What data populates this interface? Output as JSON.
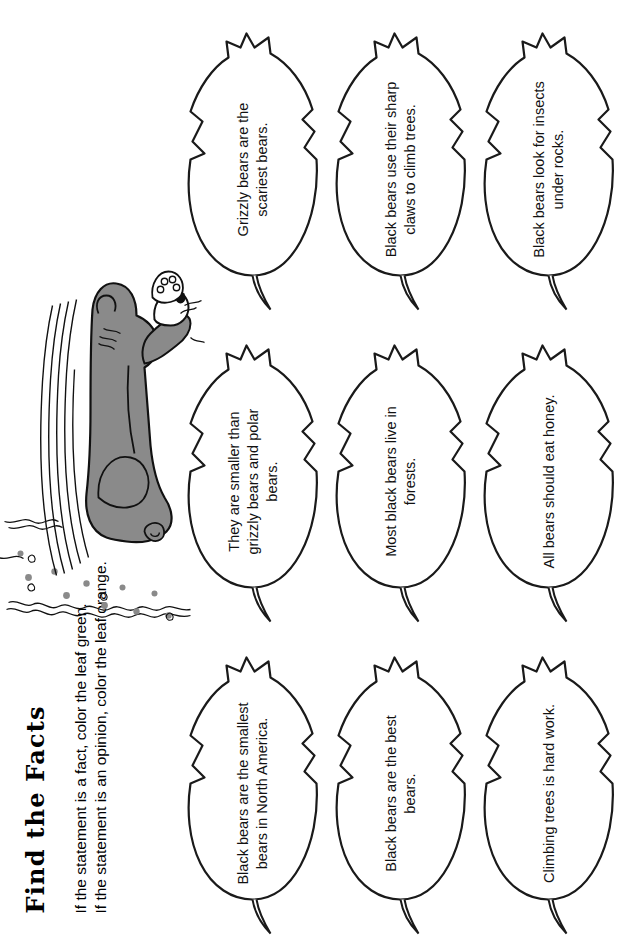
{
  "worksheet": {
    "title": "Find the Facts",
    "instructions": [
      "If the statement is a fact, color the leaf green.",
      "If the statement is an opinion, color the leaf orange."
    ]
  },
  "illustration": {
    "name": "bear-in-grass",
    "body_color": "#8a8a8a",
    "outline_color": "#111111",
    "dot_color": "#8a8a8a"
  },
  "leaves": [
    {
      "id": "leaf-1",
      "row": 0,
      "col": 0,
      "text": "Black bears are the smallest bears in North America."
    },
    {
      "id": "leaf-2",
      "row": 0,
      "col": 1,
      "text": "They are smaller than grizzly bears and polar bears."
    },
    {
      "id": "leaf-3",
      "row": 0,
      "col": 2,
      "text": "Grizzly bears are the scariest bears."
    },
    {
      "id": "leaf-4",
      "row": 1,
      "col": 0,
      "text": "Black bears are the best bears."
    },
    {
      "id": "leaf-5",
      "row": 1,
      "col": 1,
      "text": "Most black bears live in forests."
    },
    {
      "id": "leaf-6",
      "row": 1,
      "col": 2,
      "text": "Black bears use their sharp claws to climb trees."
    },
    {
      "id": "leaf-7",
      "row": 2,
      "col": 0,
      "text": "Climbing trees is hard work."
    },
    {
      "id": "leaf-8",
      "row": 2,
      "col": 1,
      "text": "All bears should eat honey."
    },
    {
      "id": "leaf-9",
      "row": 2,
      "col": 2,
      "text": "Black bears look for insects under rocks."
    }
  ],
  "colors": {
    "page_background": "#ffffff",
    "ink": "#000000",
    "leaf_fill": "#ffffff",
    "leaf_outline": "#1a1a1a",
    "leaf_shadow": "rgba(0,0,0,0.35)"
  }
}
